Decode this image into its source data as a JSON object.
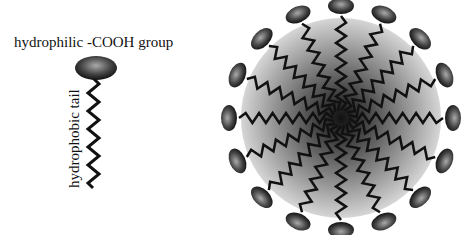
{
  "labels": {
    "head": "hydrophilic -COOH group",
    "tail": "hydrophobic tail"
  },
  "micelle": {
    "center": [
      341,
      118
    ],
    "core_radius": 100,
    "head_count": 16,
    "head_radius": 112
  },
  "colors": {
    "core_outer": "#d6d6d6",
    "core_inner": "#111111",
    "head_light": "#9a9a9a",
    "head_dark": "#1a1a1a",
    "tail": "#111111"
  }
}
